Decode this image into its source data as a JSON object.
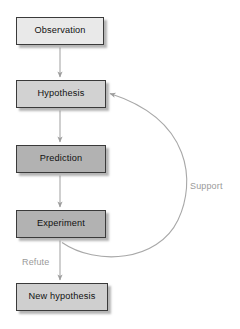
{
  "diagram": {
    "type": "flowchart",
    "background": "#ffffff",
    "nodes": [
      {
        "id": "observation",
        "label": "Observation",
        "x": 16,
        "y": 17,
        "w": 88,
        "h": 28,
        "fill": "#e9e9e9",
        "border": "#3a3a3a"
      },
      {
        "id": "hypothesis",
        "label": "Hypothesis",
        "x": 16,
        "y": 80,
        "w": 90,
        "h": 28,
        "fill": "#d2d2d2",
        "border": "#3a3a3a"
      },
      {
        "id": "prediction",
        "label": "Prediction",
        "x": 16,
        "y": 145,
        "w": 90,
        "h": 28,
        "fill": "#b2b2b2",
        "border": "#3a3a3a"
      },
      {
        "id": "experiment",
        "label": "Experiment",
        "x": 16,
        "y": 210,
        "w": 90,
        "h": 28,
        "fill": "#b2b2b2",
        "border": "#3a3a3a"
      },
      {
        "id": "new-hypothesis",
        "label": "New hypothesis",
        "x": 16,
        "y": 283,
        "w": 92,
        "h": 28,
        "fill": "#cfcfcf",
        "border": "#3a3a3a"
      }
    ],
    "edge_labels": [
      {
        "id": "support",
        "label": "Support",
        "x": 190,
        "y": 182,
        "color": "#9a9a9a"
      },
      {
        "id": "refute",
        "label": "Refute",
        "x": 22,
        "y": 258,
        "color": "#9a9a9a"
      }
    ],
    "edges": [
      {
        "from": "observation",
        "to": "hypothesis",
        "kind": "straight-down"
      },
      {
        "from": "hypothesis",
        "to": "prediction",
        "kind": "straight-down"
      },
      {
        "from": "prediction",
        "to": "experiment",
        "kind": "straight-down"
      },
      {
        "from": "experiment",
        "to": "new-hypothesis",
        "kind": "straight-down",
        "label": "Refute"
      },
      {
        "from": "experiment",
        "to": "hypothesis",
        "kind": "curved-right",
        "label": "Support"
      }
    ],
    "arrow_color": "#a0a0a0"
  }
}
